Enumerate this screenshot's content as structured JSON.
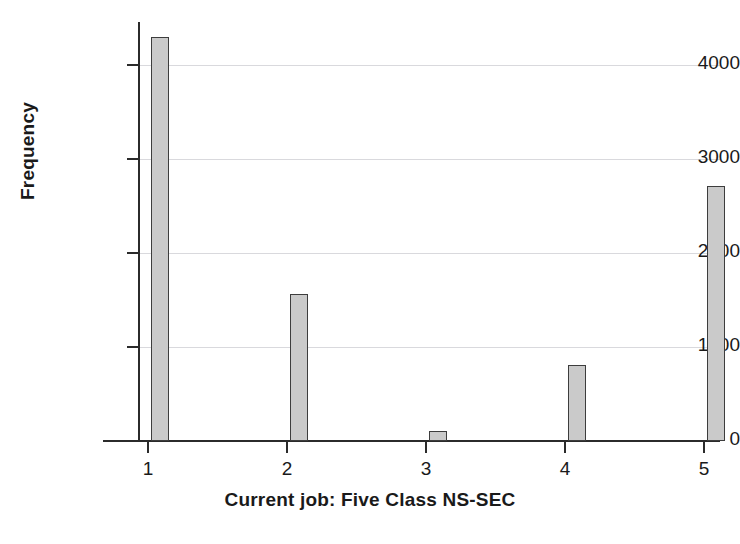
{
  "chart_data": {
    "type": "bar",
    "title": "",
    "xlabel": "Current job: Five Class NS-SEC",
    "ylabel": "Frequency",
    "categories": [
      "1",
      "2",
      "3",
      "4",
      "5"
    ],
    "values": [
      4300,
      1560,
      110,
      810,
      2710
    ],
    "series": [
      {
        "name": "Frequency",
        "values": [
          4300,
          1560,
          110,
          810,
          2710
        ]
      }
    ],
    "xlim": [
      0.5,
      5.5
    ],
    "ylim": [
      0,
      4500
    ],
    "ytick_labels": [
      "0",
      "1000",
      "2000",
      "3000",
      "4000"
    ],
    "ytick_values": [
      0,
      1000,
      2000,
      3000,
      4000
    ],
    "xtick_labels": [
      "1",
      "2",
      "3",
      "4",
      "5"
    ],
    "grid": true,
    "grid_axis": "y",
    "legend": false,
    "legend_position": "none",
    "bar_fill_color": "#cacaca",
    "bar_edge_color": "#3d3d3d",
    "axis_color": "#2b2b2b",
    "gridline_color": "#d9d9dd",
    "background_color": "#ffffff",
    "text_color": "#1a1a1a"
  },
  "axes": {
    "y_title": "Frequency",
    "x_title": "Current job: Five Class NS-SEC"
  }
}
